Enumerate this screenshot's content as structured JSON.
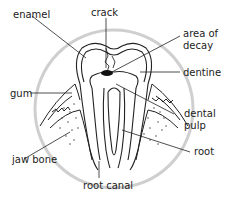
{
  "diagram": {
    "labels": {
      "enamel": "enamel",
      "crack": "crack",
      "area_of_decay_1": "area of",
      "area_of_decay_2": "decay",
      "dentine": "dentine",
      "gum": "gum",
      "dental_pulp_1": "dental",
      "dental_pulp_2": "pulp",
      "jaw_bone": "jaw bone",
      "root": "root",
      "root_canal": "root canal"
    },
    "colors": {
      "circle": "#cfcfcf",
      "line": "#222222",
      "decay": "#111111"
    }
  }
}
